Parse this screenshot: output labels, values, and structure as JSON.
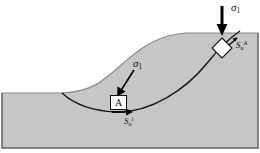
{
  "figure": {
    "name": "slope-stability-diagram",
    "colors": {
      "soil_fill": "#c6c6c6",
      "outline": "#4d4d4d",
      "slip_surface": "#1a1a1a",
      "arrow": "#000000",
      "element_fill": "#ffffff",
      "background": "#ffffff"
    }
  },
  "labels": {
    "sigma_top": {
      "symbol": "σ",
      "sub": "1"
    },
    "sigma_mid": {
      "symbol": "σ",
      "sub": "1"
    },
    "su_top": {
      "symbol": "S",
      "sub": "u",
      "sup": "A"
    },
    "su_bottom": {
      "symbol": "S",
      "sub": "u",
      "sup": "i"
    },
    "point_a": "A"
  },
  "elements": {
    "diamond": {
      "name": "soil-element-diamond",
      "location": "upper slope on slip surface"
    },
    "box_a": {
      "name": "soil-element-a",
      "location": "base of slip surface"
    }
  },
  "arrows": {
    "sigma_top_arrow": "vertical-down",
    "sigma_mid_arrow": "diagonal-down-left",
    "su_bottom_arrow": "horizontal-right"
  }
}
